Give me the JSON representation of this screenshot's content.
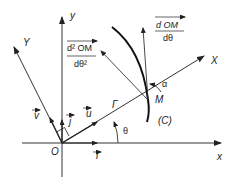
{
  "diagram": {
    "type": "geometry-polar-frame",
    "colors": {
      "line": "#333333",
      "curve": "#111111",
      "text": "#222222",
      "background": "#ffffff"
    },
    "axes": {
      "x": {
        "label": "x"
      },
      "y": {
        "label": "y"
      },
      "X": {
        "label": "X"
      },
      "Y": {
        "label": "Y"
      }
    },
    "origin": {
      "label": "O"
    },
    "vectors": {
      "i": {
        "label": "i"
      },
      "j": {
        "label": "j"
      },
      "u": {
        "label": "u"
      },
      "v": {
        "label": "v"
      }
    },
    "angles": {
      "theta": {
        "label": "θ"
      },
      "alpha": {
        "label": "α"
      }
    },
    "points": {
      "M": {
        "label": "M"
      },
      "Gamma": {
        "label": "Γ"
      }
    },
    "curve": {
      "label": "(C)"
    },
    "derivatives": {
      "first": {
        "numerator": "d OM",
        "denominator": "dθ"
      },
      "second": {
        "numerator": "d² OM",
        "denominator": "dθ²"
      }
    }
  }
}
